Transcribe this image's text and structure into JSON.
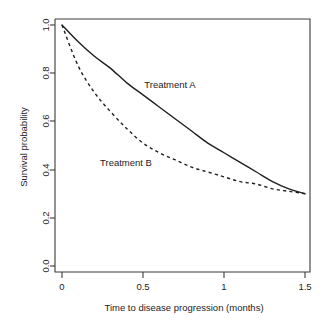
{
  "chart_data": {
    "type": "line",
    "title": "",
    "xlabel": "Time to disease progression (months)",
    "ylabel": "Survival probability",
    "xlim": [
      0,
      1.5
    ],
    "ylim": [
      0,
      1.0
    ],
    "grid": false,
    "legend_position": "inline-annotations",
    "xticks": [
      "0",
      "0.5",
      "1",
      "1.5"
    ],
    "xtick_values": [
      0,
      0.5,
      1,
      1.5
    ],
    "yticks": [
      "0.0",
      "0.2",
      "0.4",
      "0.6",
      "0.8",
      "1.0"
    ],
    "ytick_values": [
      0.0,
      0.2,
      0.4,
      0.6,
      0.8,
      1.0
    ],
    "x": [
      0,
      0.1,
      0.2,
      0.3,
      0.4,
      0.5,
      0.6,
      0.7,
      0.8,
      0.9,
      1.0,
      1.1,
      1.2,
      1.3,
      1.4,
      1.5
    ],
    "series": [
      {
        "name": "Treatment A",
        "style": "solid",
        "color": "#1f1f1f",
        "values": [
          1.0,
          0.93,
          0.87,
          0.82,
          0.76,
          0.71,
          0.66,
          0.61,
          0.56,
          0.51,
          0.47,
          0.43,
          0.39,
          0.35,
          0.32,
          0.3
        ]
      },
      {
        "name": "Treatment B",
        "style": "dashed",
        "color": "#1f1f1f",
        "values": [
          1.0,
          0.83,
          0.72,
          0.64,
          0.57,
          0.51,
          0.47,
          0.44,
          0.41,
          0.39,
          0.37,
          0.35,
          0.34,
          0.32,
          0.31,
          0.3
        ]
      }
    ],
    "annotations": [
      {
        "text": "Treatment A",
        "x": 0.67,
        "y": 0.855
      },
      {
        "text": "Treatment B",
        "x": 0.44,
        "y": 0.525
      }
    ]
  },
  "axes": {
    "x_title": "Time to disease progression (months)",
    "y_title": "Survival probability"
  },
  "labels": {
    "treatment_a": "Treatment A",
    "treatment_b": "Treatment B"
  },
  "ticks": {
    "x": [
      "0",
      "0.5",
      "1",
      "1.5"
    ],
    "y": [
      "0.0",
      "0.2",
      "0.4",
      "0.6",
      "0.8",
      "1.0"
    ]
  }
}
